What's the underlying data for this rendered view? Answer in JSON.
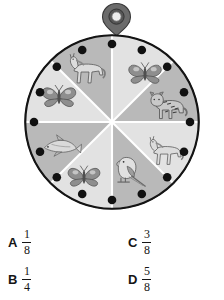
{
  "figure": {
    "name": "probability-spinner",
    "pointer": {
      "icon": "spinner-pointer-icon",
      "body_color": "#6e6e6e",
      "ring_color": "#4a4a4a",
      "center_color": "#e8e8e8"
    },
    "wheel": {
      "center_x": 112,
      "center_y": 122,
      "radius": 86,
      "rim_color": "#1a1a1a",
      "divider_color": "#ffffff",
      "segment_count": 8,
      "rim_dot_count": 16,
      "rim_dot_color": "#111111",
      "colors": {
        "light": "#e2e2e2",
        "medium": "#b9b9b9"
      },
      "segments": [
        {
          "index": 1,
          "icon": "butterfly-icon",
          "animal": "butterfly",
          "shade": "light",
          "start_angle": 0,
          "end_angle": 45
        },
        {
          "index": 2,
          "icon": "tiger-icon",
          "animal": "tiger",
          "shade": "medium",
          "start_angle": 45,
          "end_angle": 90
        },
        {
          "index": 3,
          "icon": "horse-icon",
          "animal": "horse",
          "shade": "light",
          "start_angle": 90,
          "end_angle": 135
        },
        {
          "index": 4,
          "icon": "parrot-icon",
          "animal": "parrot",
          "shade": "medium",
          "start_angle": 135,
          "end_angle": 180
        },
        {
          "index": 5,
          "icon": "butterfly-icon",
          "animal": "butterfly",
          "shade": "light",
          "start_angle": 180,
          "end_angle": 225
        },
        {
          "index": 6,
          "icon": "fish-icon",
          "animal": "fish",
          "shade": "medium",
          "start_angle": 225,
          "end_angle": 270
        },
        {
          "index": 7,
          "icon": "butterfly-icon",
          "animal": "butterfly",
          "shade": "light",
          "start_angle": 270,
          "end_angle": 315
        },
        {
          "index": 8,
          "icon": "horse-icon",
          "animal": "horse",
          "shade": "medium",
          "start_angle": 315,
          "end_angle": 360
        }
      ]
    }
  },
  "answers": {
    "a": {
      "letter": "A",
      "numerator": "1",
      "denominator": "8"
    },
    "b": {
      "letter": "B",
      "numerator": "1",
      "denominator": "4"
    },
    "c": {
      "letter": "C",
      "numerator": "3",
      "denominator": "8"
    },
    "d": {
      "letter": "D",
      "numerator": "5",
      "denominator": "8"
    }
  }
}
